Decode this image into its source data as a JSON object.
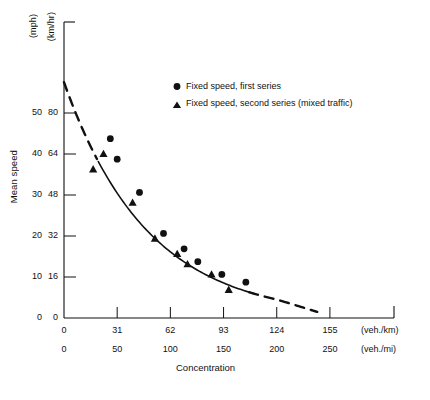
{
  "chart_data": {
    "type": "scatter",
    "title": "",
    "xlabel": "Concentration",
    "ylabel": "Mean speed",
    "x_unit_primary": "(veh./km)",
    "x_unit_secondary": "(veh./mi)",
    "y_unit_primary": "(km/hr)",
    "y_unit_secondary": "(mph)",
    "grid": false,
    "legend_position": "upper right",
    "xlim": [
      0,
      168
    ],
    "ylim": [
      0,
      92
    ],
    "x_ticks_primary": [
      0,
      31,
      62,
      93,
      124,
      155
    ],
    "x_ticks_secondary": [
      0,
      50,
      100,
      150,
      200,
      250
    ],
    "y_ticks_primary": [
      0,
      16,
      32,
      48,
      64,
      80
    ],
    "y_ticks_secondary": [
      0,
      10,
      20,
      30,
      40,
      50
    ],
    "series": [
      {
        "name": "Fixed speed, first series",
        "marker": "circle",
        "points": [
          {
            "x": 27,
            "y": 70
          },
          {
            "x": 31,
            "y": 62
          },
          {
            "x": 44,
            "y": 49
          },
          {
            "x": 58,
            "y": 33
          },
          {
            "x": 70,
            "y": 27
          },
          {
            "x": 78,
            "y": 22
          },
          {
            "x": 92,
            "y": 17
          },
          {
            "x": 106,
            "y": 14
          }
        ]
      },
      {
        "name": "Fixed speed, second series (mixed traffic)",
        "marker": "triangle",
        "points": [
          {
            "x": 23,
            "y": 64
          },
          {
            "x": 17,
            "y": 58
          },
          {
            "x": 40,
            "y": 45
          },
          {
            "x": 53,
            "y": 31
          },
          {
            "x": 66,
            "y": 25
          },
          {
            "x": 72,
            "y": 21
          },
          {
            "x": 86,
            "y": 17
          },
          {
            "x": 96,
            "y": 11
          }
        ]
      }
    ],
    "fit_curve": {
      "name": "fitted exponential speed-concentration curve",
      "solid_range": [
        20,
        108
      ],
      "dashed_ranges": [
        [
          0,
          20
        ],
        [
          108,
          148
        ]
      ],
      "y_at_zero": 92,
      "y_at_end": 0
    },
    "legend": [
      {
        "marker": "circle",
        "label": "Fixed speed, first series"
      },
      {
        "marker": "triangle",
        "label": "Fixed speed, second series (mixed traffic)"
      }
    ]
  }
}
